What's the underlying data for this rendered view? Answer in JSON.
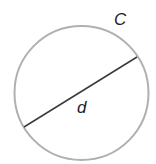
{
  "diagram": {
    "circle": {
      "cx": 81.5,
      "cy": 93,
      "r": 67,
      "stroke": "#b0b0b0",
      "stroke_width": 2
    },
    "diameter": {
      "x1": 24,
      "y1": 127,
      "x2": 137,
      "y2": 57,
      "stroke": "#3a3a3a",
      "stroke_width": 1.5
    },
    "labels": {
      "circumference": "C",
      "diameter": "d"
    }
  }
}
